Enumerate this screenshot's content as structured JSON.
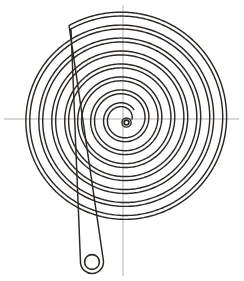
{
  "figure": {
    "title": "Spiral spring (Archimedean flat coil) technical drawing",
    "background_color": "#ffffff",
    "width": 244,
    "height": 281
  },
  "style": {
    "spiral_color": "#2b2724",
    "spiral_width": 1.45,
    "axis_color": "#a8a8a8",
    "axis_width": 0.9,
    "eyelet_color": "#2b2724",
    "eyelet_width": 1.6
  },
  "center": {
    "x": 123,
    "y": 119,
    "label": "spiral-center"
  },
  "axes": {
    "horizontal": {
      "x1": 4,
      "y1": 119,
      "x2": 239,
      "y2": 119,
      "label": "horizontal-axis"
    },
    "vertical": {
      "x1": 123,
      "y1": 5,
      "x2": 123,
      "y2": 276,
      "label": "vertical-axis"
    }
  },
  "spiral": {
    "type": "archimedean",
    "turns": 7.6,
    "inner_radius": 5.5,
    "outer_radius": 104,
    "band_offset": 3.9,
    "start_angle_deg": 96,
    "direction": "counterclockwise",
    "stroke_count": 2,
    "extent_top_y": 16,
    "extent_left_x": 21,
    "extent_right_x": 229,
    "extent_bottom_y": 224
  },
  "inner_eyelet": {
    "cx": 126.5,
    "cy": 122.5,
    "r_outer": 4.6,
    "r_inner": 2.4,
    "label": "inner-eyelet"
  },
  "tail": {
    "label": "outer-tail",
    "terminal_cx": 92,
    "terminal_cy": 262,
    "terminal_r_outer": 11.5,
    "terminal_r_inner": 7.4,
    "straight_from_x": 196,
    "straight_from_y": 232
  },
  "annotations": {
    "has_text_labels": false,
    "label_list": []
  },
  "chart_data": {
    "type": "line",
    "xlabel": "",
    "ylabel": "",
    "grid": false,
    "legend_position": "none",
    "series": [
      {
        "name": "spiral-outer-edge",
        "turns": 7.6,
        "r_start": 9.4,
        "r_end": 104
      },
      {
        "name": "spiral-inner-edge",
        "turns": 7.6,
        "r_start": 5.5,
        "r_end": 100.1
      }
    ],
    "axis_crossings_right": 8,
    "axis_crossings_left": 8
  }
}
